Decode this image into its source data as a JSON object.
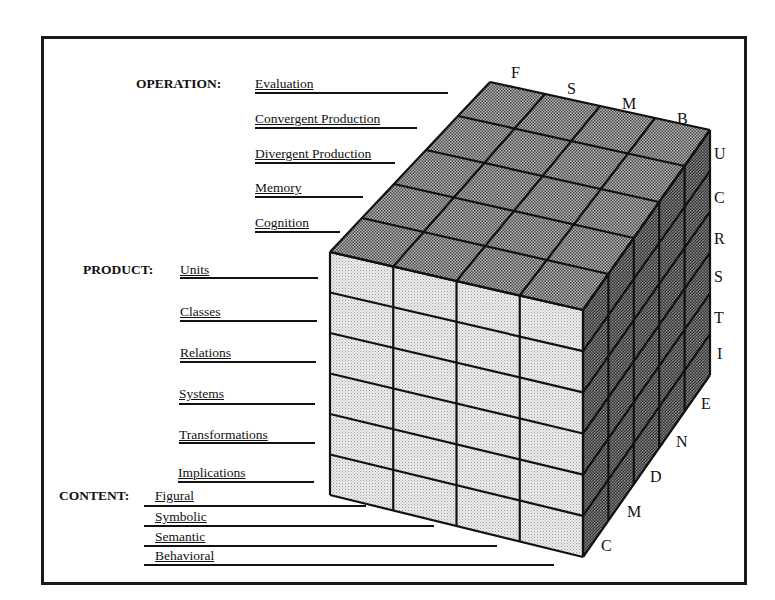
{
  "diagram": {
    "dimensions": {
      "operation": {
        "label": "OPERATION:",
        "items": [
          "Evaluation",
          "Convergent Production",
          "Divergent Production",
          "Memory",
          "Cognition"
        ]
      },
      "product": {
        "label": "PRODUCT:",
        "items": [
          "Units",
          "Classes",
          "Relations",
          "Systems",
          "Transformations",
          "Implications"
        ]
      },
      "content": {
        "label": "CONTENT:",
        "items": [
          "Figural",
          "Symbolic",
          "Semantic",
          "Behavioral"
        ]
      }
    },
    "axis_letters": {
      "top_edge": [
        "F",
        "S",
        "M",
        "B"
      ],
      "right_edge": [
        "U",
        "C",
        "R",
        "S",
        "T",
        "I"
      ],
      "diagonal_edge": [
        "E",
        "N",
        "D",
        "M",
        "C"
      ]
    },
    "grid": {
      "columns": 4,
      "rows": 6,
      "depth": 5
    },
    "colors": {
      "top_face": "#8a8a8a",
      "front_face": "#e2e2e2",
      "side_face": "#4a4a4a",
      "lines": "#111111"
    }
  }
}
